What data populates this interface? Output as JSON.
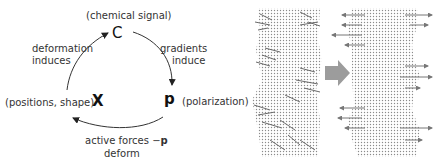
{
  "cycle": {
    "nodes": {
      "c": {
        "symbol": "C",
        "label": "(chemical signal)"
      },
      "p": {
        "symbol": "p",
        "label": "(polarization)"
      },
      "x": {
        "symbol": "X",
        "label": "(positions, shape)"
      }
    },
    "edges": {
      "c_to_p": {
        "line1": "gradients",
        "line2": "induce"
      },
      "p_to_x": {
        "line1": "active forces −",
        "line1_bold": "p",
        "line2": "deform"
      },
      "x_to_c": {
        "line1": "deformation",
        "line2": "induces"
      }
    }
  },
  "simulation": {
    "before_panel": "cell-tissue-before",
    "transition_arrow": "right-arrow",
    "after_panel": "cell-tissue-after",
    "colors": {
      "dots": "#8a8a8a",
      "arrows": "#7a7a7a",
      "transition_arrow": "#9c9c9c"
    }
  }
}
